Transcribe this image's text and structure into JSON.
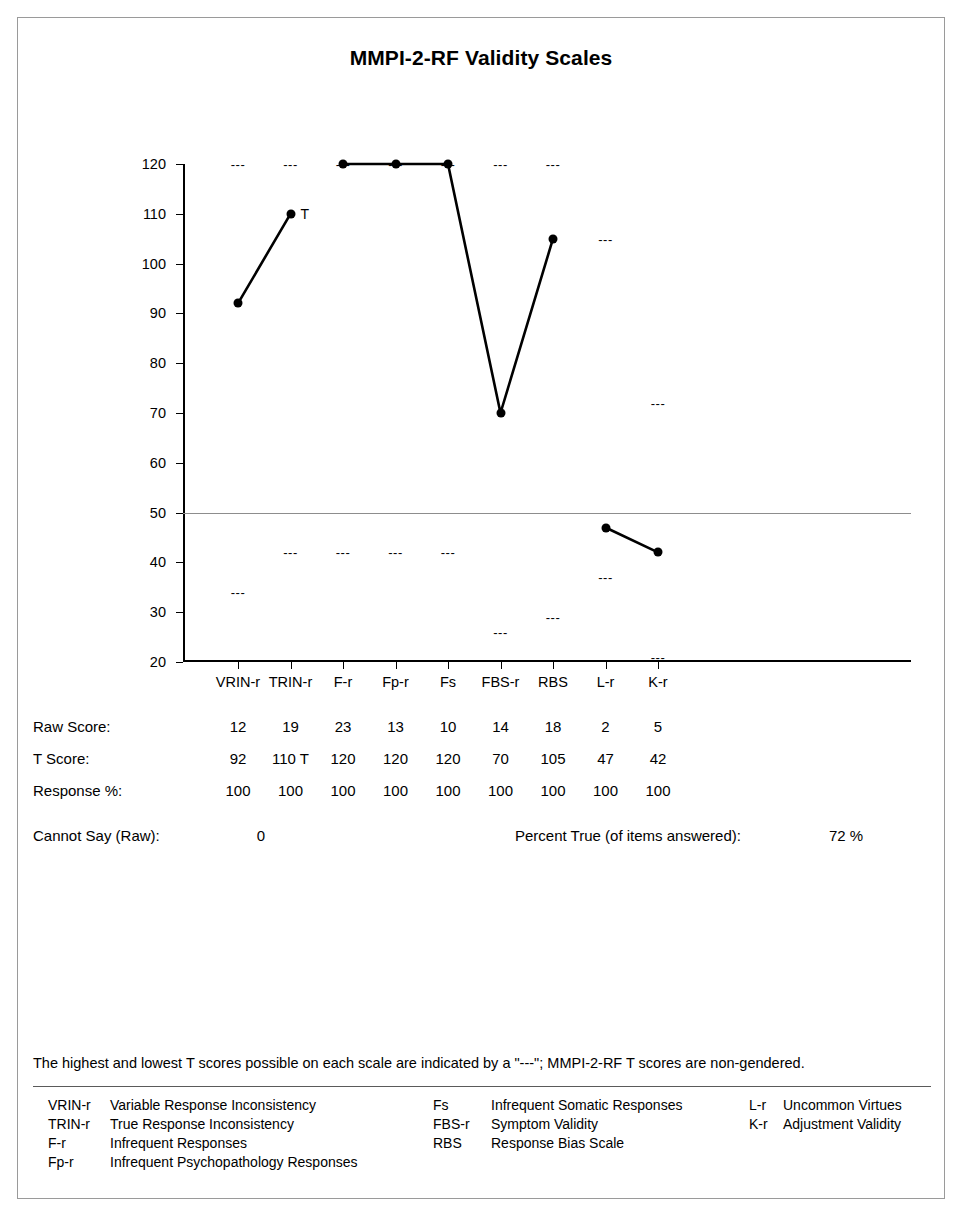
{
  "report": {
    "title": "MMPI-2-RF Validity Scales"
  },
  "chart_data": {
    "type": "line",
    "title": "MMPI-2-RF Validity Scales",
    "xlabel": "",
    "ylabel": "T Score",
    "ylim": [
      20,
      120
    ],
    "yticks": [
      120,
      110,
      100,
      90,
      80,
      70,
      60,
      50,
      40,
      30,
      20
    ],
    "grid": false,
    "reference_line": 50,
    "legend_position": "none",
    "categories": [
      "VRIN-r",
      "TRIN-r",
      "F-r",
      "Fp-r",
      "Fs",
      "FBS-r",
      "RBS",
      "L-r",
      "K-r"
    ],
    "series": [
      {
        "name": "T Score",
        "values": [
          92,
          110,
          120,
          120,
          120,
          70,
          105,
          47,
          42
        ],
        "segments": [
          [
            0,
            1
          ],
          [
            2,
            3,
            4,
            5,
            6
          ],
          [
            7,
            8
          ]
        ]
      }
    ],
    "max_possible": [
      120,
      120,
      120,
      120,
      120,
      120,
      120,
      105,
      72
    ],
    "min_possible": [
      34,
      42,
      42,
      42,
      42,
      26,
      29,
      37,
      21
    ],
    "annotations": [
      {
        "category": "TRIN-r",
        "value": 110,
        "text": "T"
      }
    ]
  },
  "scores": {
    "columns": [
      "VRIN-r",
      "TRIN-r",
      "F-r",
      "Fp-r",
      "Fs",
      "FBS-r",
      "RBS",
      "L-r",
      "K-r"
    ],
    "rows": [
      {
        "label": "Raw Score:",
        "values": [
          "12",
          "19",
          "23",
          "13",
          "10",
          "14",
          "18",
          "2",
          "5"
        ]
      },
      {
        "label": "T Score:",
        "values": [
          "92",
          "110 T",
          "120",
          "120",
          "120",
          "70",
          "105",
          "47",
          "42"
        ]
      },
      {
        "label": "Response %:",
        "values": [
          "100",
          "100",
          "100",
          "100",
          "100",
          "100",
          "100",
          "100",
          "100"
        ]
      }
    ],
    "cannot_say_label": "Cannot Say (Raw):",
    "cannot_say_value": "0",
    "percent_true_label": "Percent True (of items answered):",
    "percent_true_value": "72 %"
  },
  "footer": {
    "note": "The highest and lowest T scores possible on each scale are indicated by a \"---\"; MMPI-2-RF T scores are non-gendered.",
    "legend_columns": [
      [
        {
          "abbr": "VRIN-r",
          "desc": "Variable Response Inconsistency"
        },
        {
          "abbr": "TRIN-r",
          "desc": "True Response Inconsistency"
        },
        {
          "abbr": "F-r",
          "desc": "Infrequent Responses"
        },
        {
          "abbr": "Fp-r",
          "desc": "Infrequent Psychopathology Responses"
        }
      ],
      [
        {
          "abbr": "Fs",
          "desc": "Infrequent Somatic Responses"
        },
        {
          "abbr": "FBS-r",
          "desc": "Symptom Validity"
        },
        {
          "abbr": "RBS",
          "desc": "Response Bias Scale"
        }
      ],
      [
        {
          "abbr": "L-r",
          "desc": "Uncommon Virtues"
        },
        {
          "abbr": "K-r",
          "desc": "Adjustment Validity"
        }
      ]
    ]
  },
  "markers": {
    "limit_dash": "---"
  },
  "colors": {
    "ink": "#000000",
    "frame": "#9a9a9a",
    "reference_line": "#8d8d8d"
  }
}
